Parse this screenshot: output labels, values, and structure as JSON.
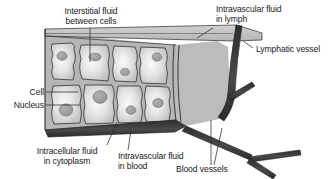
{
  "figure": {
    "type": "biological-diagram"
  },
  "labels": {
    "interstitial": "Interstitial fluid\nbetween cells",
    "intravascular_lymph": "Intravascular fluid\nin lymph",
    "lymphatic_vessel": "Lymphatic vessel",
    "cell": "Cell",
    "nucleus": "Nucleus",
    "intracellular": "Intracellular fluid\nin cytoplasm",
    "intravascular_blood": "Intravascular fluid\nin blood",
    "blood_vessels": "Blood vessels"
  },
  "colors": {
    "outline": "#1a1a1a",
    "cell_fill": "#c9c9c9",
    "cell_highlight": "#f2f2f2",
    "nucleus_fill": "#9a9a9a",
    "interstitial_fill": "#b4b4b4",
    "lymph_fill": "#bdbdbd",
    "lymph_band": "#c4c4c4",
    "blood_vessel": "#3a3a3a",
    "background": "#ffffff",
    "leader_line": "#2b2b2b"
  },
  "structures": {
    "cells_top_row": 4,
    "cells_bottom_row": 4,
    "nuclei_count": 8,
    "vessel_branches": 3
  }
}
